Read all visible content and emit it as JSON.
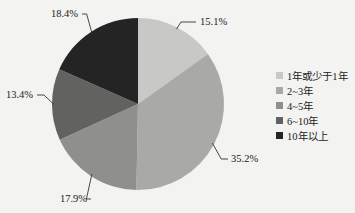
{
  "chart_data": {
    "type": "pie",
    "title": "",
    "categories": [
      "1年或少于1年",
      "2~3年",
      "4~5年",
      "6~10年",
      "10年以上"
    ],
    "values": [
      15.1,
      35.2,
      17.9,
      13.4,
      18.4
    ],
    "labels": [
      "15.1%",
      "35.2%",
      "17.9%",
      "13.4%",
      "18.4%"
    ],
    "colors": [
      "#c8c8c6",
      "#a9a9a7",
      "#8f8f8d",
      "#626260",
      "#242424"
    ],
    "start_angle": "12 o'clock",
    "direction": "clockwise",
    "legend_position": "right"
  },
  "legend": {
    "items": [
      {
        "label": "1年或少于1年",
        "color": "#c8c8c6"
      },
      {
        "label": "2~3年",
        "color": "#a9a9a7"
      },
      {
        "label": "4~5年",
        "color": "#8f8f8d"
      },
      {
        "label": "6~10年",
        "color": "#626260"
      },
      {
        "label": "10年以上",
        "color": "#242424"
      }
    ]
  }
}
